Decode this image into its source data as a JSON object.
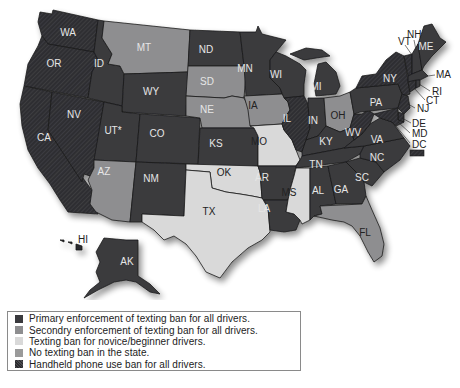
{
  "map": {
    "title": "",
    "categories": {
      "primary": {
        "label": "Primary enforcement of texting ban for all drivers.",
        "color": "#3a3a3e"
      },
      "secondary": {
        "label": "Secondry enforcement of texting ban for all drivers.",
        "color": "#8e8e90"
      },
      "novice": {
        "label": "Texting ban for novice/beginner drivers.",
        "color": "#d9d9d9"
      },
      "none": {
        "label": "No texting ban in the state.",
        "color": "#9a9a9a"
      },
      "handheld": {
        "label": "Handheld phone use ban for all drivers.",
        "color": "#2a2a2e"
      }
    },
    "states": {
      "WA": {
        "label": "WA",
        "category": "handheld"
      },
      "OR": {
        "label": "OR",
        "category": "handheld"
      },
      "CA": {
        "label": "CA",
        "category": "handheld"
      },
      "NV": {
        "label": "NV",
        "category": "handheld"
      },
      "ID": {
        "label": "ID",
        "category": "primary"
      },
      "MT": {
        "label": "MT",
        "category": "none"
      },
      "WY": {
        "label": "WY",
        "category": "primary"
      },
      "UT": {
        "label": "UT*",
        "category": "primary"
      },
      "CO": {
        "label": "CO",
        "category": "primary"
      },
      "AZ": {
        "label": "AZ",
        "category": "none"
      },
      "NM": {
        "label": "NM",
        "category": "primary"
      },
      "ND": {
        "label": "ND",
        "category": "primary"
      },
      "SD": {
        "label": "SD",
        "category": "secondary"
      },
      "NE": {
        "label": "NE",
        "category": "secondary"
      },
      "KS": {
        "label": "KS",
        "category": "primary"
      },
      "OK": {
        "label": "OK",
        "category": "novice"
      },
      "TX": {
        "label": "TX",
        "category": "novice"
      },
      "MN": {
        "label": "MN",
        "category": "primary"
      },
      "IA": {
        "label": "IA",
        "category": "secondary"
      },
      "MO": {
        "label": "MO",
        "category": "novice"
      },
      "AR": {
        "label": "AR",
        "category": "primary"
      },
      "LA": {
        "label": "LA",
        "category": "primary"
      },
      "WI": {
        "label": "WI",
        "category": "primary"
      },
      "IL": {
        "label": "IL",
        "category": "handheld"
      },
      "MI": {
        "label": "MI",
        "category": "primary"
      },
      "IN": {
        "label": "IN",
        "category": "primary"
      },
      "OH": {
        "label": "OH",
        "category": "secondary"
      },
      "KY": {
        "label": "KY",
        "category": "primary"
      },
      "TN": {
        "label": "TN",
        "category": "primary"
      },
      "MS": {
        "label": "MS",
        "category": "novice"
      },
      "AL": {
        "label": "AL",
        "category": "primary"
      },
      "GA": {
        "label": "GA",
        "category": "primary"
      },
      "FL": {
        "label": "FL",
        "category": "secondary"
      },
      "SC": {
        "label": "SC",
        "category": "primary"
      },
      "NC": {
        "label": "NC",
        "category": "primary"
      },
      "VA": {
        "label": "VA",
        "category": "primary"
      },
      "WV": {
        "label": "WV",
        "category": "handheld"
      },
      "PA": {
        "label": "PA",
        "category": "primary"
      },
      "NY": {
        "label": "NY",
        "category": "handheld"
      },
      "VT": {
        "label": "VT",
        "category": "handheld"
      },
      "NH": {
        "label": "NH",
        "category": "primary"
      },
      "ME": {
        "label": "ME",
        "category": "primary"
      },
      "MA": {
        "label": "MA",
        "category": "primary"
      },
      "RI": {
        "label": "RI",
        "category": "primary"
      },
      "CT": {
        "label": "CT",
        "category": "handheld"
      },
      "NJ": {
        "label": "NJ",
        "category": "handheld"
      },
      "DE": {
        "label": "DE",
        "category": "handheld"
      },
      "MD": {
        "label": "MD",
        "category": "handheld"
      },
      "DC": {
        "label": "DC",
        "category": "handheld"
      },
      "AK": {
        "label": "AK",
        "category": "primary"
      },
      "HI": {
        "label": "HI",
        "category": "handheld"
      }
    }
  },
  "legend": {
    "items": [
      {
        "label": "Primary enforcement of texting ban for all drivers.",
        "color": "#3a3a3e"
      },
      {
        "label": "Secondry enforcement of texting ban for all drivers.",
        "color": "#8e8e90"
      },
      {
        "label": "Texting ban for novice/beginner drivers.",
        "color": "#d9d9d9"
      },
      {
        "label": "No texting ban in the state.",
        "color": "#9a9a9a"
      },
      {
        "label": "Handheld phone use ban for all drivers.",
        "color": "#2a2a2e"
      }
    ]
  }
}
